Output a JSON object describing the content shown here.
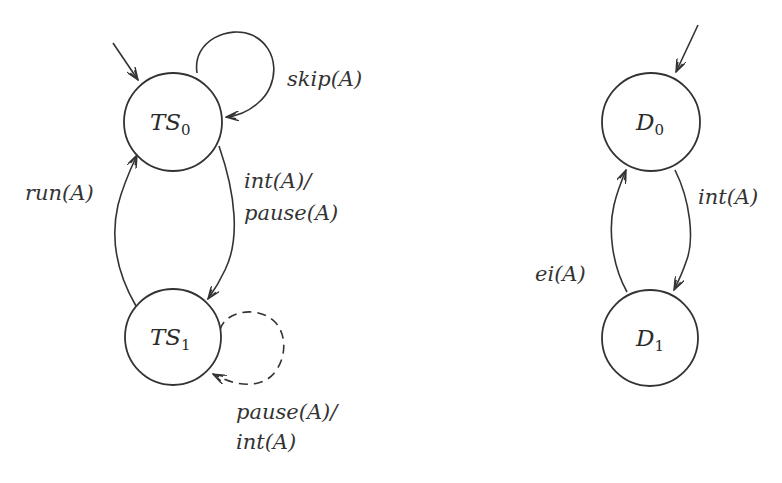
{
  "diagram": {
    "title": "",
    "machines": [
      {
        "id": "TS",
        "states": [
          {
            "id": "TS0",
            "base": "TS",
            "sub": "0",
            "initial": true
          },
          {
            "id": "TS1",
            "base": "TS",
            "sub": "1",
            "initial": false
          }
        ],
        "transitions": [
          {
            "from": "TS0",
            "to": "TS0",
            "label": "skip(A)",
            "style": "solid"
          },
          {
            "from": "TS0",
            "to": "TS1",
            "label_line1": "int(A)/",
            "label_line2": "pause(A)",
            "style": "solid"
          },
          {
            "from": "TS1",
            "to": "TS0",
            "label": "run(A)",
            "style": "solid"
          },
          {
            "from": "TS1",
            "to": "TS1",
            "label_line1": "pause(A)/",
            "label_line2": "int(A)",
            "style": "dashed"
          }
        ]
      },
      {
        "id": "D",
        "states": [
          {
            "id": "D0",
            "base": "D",
            "sub": "0",
            "initial": true
          },
          {
            "id": "D1",
            "base": "D",
            "sub": "1",
            "initial": false
          }
        ],
        "transitions": [
          {
            "from": "D0",
            "to": "D1",
            "label": "int(A)",
            "style": "solid"
          },
          {
            "from": "D1",
            "to": "D0",
            "label": "ei(A)",
            "style": "solid"
          }
        ]
      }
    ]
  },
  "colors": {
    "stroke": "#333333",
    "background": "#ffffff"
  }
}
